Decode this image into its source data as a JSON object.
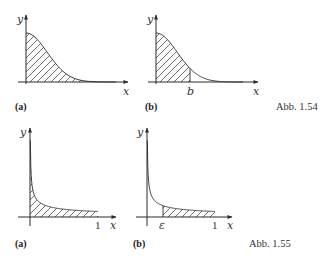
{
  "figures": [
    {
      "caption": "Abb. 1.54",
      "panels": [
        {
          "label": "(a)",
          "x_label": "x",
          "y_label": "y",
          "function": "bell-shaped decay, y = e^(-x^2) like",
          "shaded": "entire region under curve from 0 to infinity",
          "tick_labels": []
        },
        {
          "label": "(b)",
          "x_label": "x",
          "y_label": "y",
          "function": "bell-shaped decay, y = e^(-x^2) like",
          "shaded": "region under curve from 0 to b",
          "tick_labels": [
            "b"
          ]
        }
      ]
    },
    {
      "caption": "Abb. 1.55",
      "panels": [
        {
          "label": "(a)",
          "x_label": "x",
          "y_label": "y",
          "function": "singular at 0, y = 1/sqrt(x) like",
          "shaded": "region under curve from 0 to 1",
          "tick_labels": [
            "1"
          ]
        },
        {
          "label": "(b)",
          "x_label": "x",
          "y_label": "y",
          "function": "singular at 0, y = 1/sqrt(x) like",
          "shaded": "region under curve from epsilon to 1",
          "tick_labels": [
            "ε",
            "1"
          ]
        }
      ]
    }
  ]
}
